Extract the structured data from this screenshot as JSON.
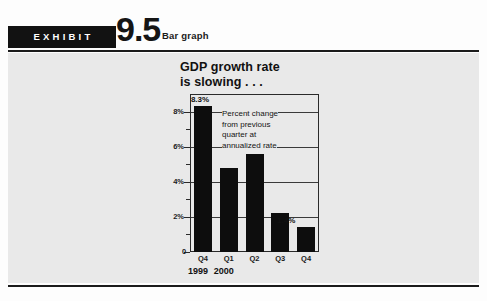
{
  "exhibit": {
    "tag_label": "EXHIBIT",
    "number": "9.5",
    "kind": "Bar graph"
  },
  "colors": {
    "bar": "#0d0d0d",
    "panel_background": "#e9e9e9",
    "rule": "#1b1b1b",
    "tag_background": "#121212",
    "text": "#111111"
  },
  "chart_data": {
    "type": "bar",
    "title": "GDP growth rate\nis slowing . . .",
    "annotation": "Percent change\nfrom previous\nquarter at\nannualized rate",
    "categories": [
      "Q4",
      "Q1",
      "Q2",
      "Q3",
      "Q4"
    ],
    "values": [
      8.3,
      4.8,
      5.6,
      2.2,
      1.4
    ],
    "value_labels": [
      "8.3%",
      "",
      "",
      "",
      "1.4%"
    ],
    "group_labels": [
      {
        "label": "1999",
        "categories": [
          "Q4"
        ]
      },
      {
        "label": "2000",
        "categories": [
          "Q1",
          "Q2",
          "Q3",
          "Q4"
        ]
      }
    ],
    "xlabel": "",
    "ylabel": "",
    "ylim": [
      0,
      9
    ],
    "ytick_labels": [
      "0",
      "2%",
      "4%",
      "6%",
      "8%"
    ],
    "ytick_values": [
      0,
      2,
      4,
      6,
      8
    ],
    "yminor_values": [
      1,
      3,
      5,
      7
    ],
    "gridlines": [
      2,
      4,
      6,
      8
    ],
    "grid": true,
    "legend": "none",
    "units": "percent"
  }
}
